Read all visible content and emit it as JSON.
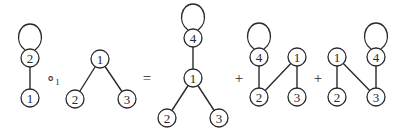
{
  "diagram": {
    "type": "graph-composition-equation",
    "graphs": [
      {
        "id": "g1",
        "nodes": [
          {
            "label": "2",
            "x": 30,
            "y": 58,
            "loop": true
          },
          {
            "label": "1",
            "x": 30,
            "y": 98,
            "loop": false
          }
        ],
        "edges": [
          [
            0,
            1
          ]
        ]
      },
      {
        "id": "g2",
        "nodes": [
          {
            "label": "1",
            "x": 100,
            "y": 59,
            "loop": false
          },
          {
            "label": "2",
            "x": 75,
            "y": 99,
            "loop": false
          },
          {
            "label": "3",
            "x": 127,
            "y": 99,
            "loop": false
          }
        ],
        "edges": [
          [
            0,
            1
          ],
          [
            0,
            2
          ]
        ]
      },
      {
        "id": "g3",
        "nodes": [
          {
            "label": "4",
            "x": 193,
            "y": 38,
            "loop": true
          },
          {
            "label": "1",
            "x": 193,
            "y": 78,
            "loop": false
          },
          {
            "label": "2",
            "x": 167,
            "y": 118,
            "loop": false
          },
          {
            "label": "3",
            "x": 219,
            "y": 118,
            "loop": false
          }
        ],
        "edges": [
          [
            0,
            1
          ],
          [
            1,
            2
          ],
          [
            1,
            3
          ]
        ]
      },
      {
        "id": "g4",
        "nodes": [
          {
            "label": "4",
            "x": 259,
            "y": 57,
            "loop": true
          },
          {
            "label": "2",
            "x": 259,
            "y": 97,
            "loop": false
          },
          {
            "label": "1",
            "x": 297,
            "y": 57,
            "loop": false
          },
          {
            "label": "3",
            "x": 297,
            "y": 97,
            "loop": false
          }
        ],
        "edges": [
          [
            0,
            1
          ],
          [
            2,
            1
          ],
          [
            2,
            3
          ]
        ]
      },
      {
        "id": "g5",
        "nodes": [
          {
            "label": "1",
            "x": 337,
            "y": 57,
            "loop": false
          },
          {
            "label": "2",
            "x": 337,
            "y": 97,
            "loop": false
          },
          {
            "label": "3",
            "x": 376,
            "y": 97,
            "loop": false
          },
          {
            "label": "4",
            "x": 376,
            "y": 57,
            "loop": true
          }
        ],
        "edges": [
          [
            0,
            1
          ],
          [
            0,
            2
          ],
          [
            3,
            2
          ]
        ]
      }
    ],
    "operators": [
      {
        "symbol": "∘",
        "subscript": "1",
        "x": 53,
        "y": 78
      },
      {
        "symbol": "=",
        "subscript": "",
        "x": 147,
        "y": 78
      },
      {
        "symbol": "+",
        "subscript": "",
        "x": 239,
        "y": 78
      },
      {
        "symbol": "+",
        "subscript": "",
        "x": 318,
        "y": 78
      }
    ],
    "node_radius": 9
  }
}
